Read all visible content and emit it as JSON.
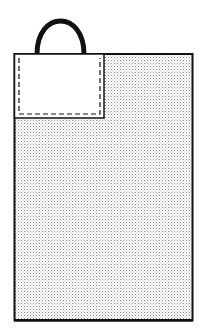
{
  "diagram": {
    "colors": {
      "background": "#ffffff",
      "outline": "#111111",
      "stipple_dot": "#8a8a8a",
      "pocket_fill": "#ffffff"
    },
    "parts": [
      {
        "name": "handle",
        "shape": "arch"
      },
      {
        "name": "bag-body",
        "shape": "rectangle",
        "fill": "stippled"
      },
      {
        "name": "pocket",
        "shape": "rectangle",
        "fill": "white",
        "stitching": "dashed"
      }
    ]
  }
}
